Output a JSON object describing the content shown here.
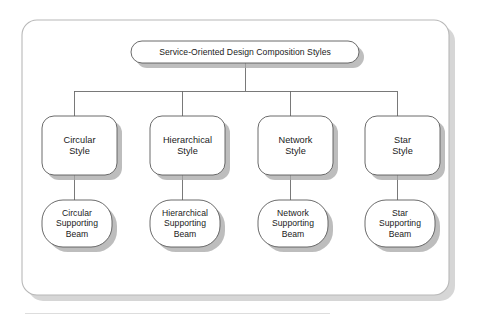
{
  "diagram": {
    "type": "tree",
    "root": {
      "id": "root",
      "label": "Service-Oriented Design Composition Styles",
      "shape": "stadium"
    },
    "columns": [
      {
        "id": "circular",
        "style": {
          "line1": "Circular",
          "line2": "Style",
          "shape": "rounded-rect"
        },
        "beam": {
          "line1": "Circular",
          "line2": "Supporting",
          "line3": "Beam",
          "shape": "stadium"
        }
      },
      {
        "id": "hierarchical",
        "style": {
          "line1": "Hierarchical",
          "line2": "Style",
          "shape": "rounded-rect"
        },
        "beam": {
          "line1": "Hierarchical",
          "line2": "Supporting",
          "line3": "Beam",
          "shape": "stadium"
        }
      },
      {
        "id": "network",
        "style": {
          "line1": "Network",
          "line2": "Style",
          "shape": "rounded-rect"
        },
        "beam": {
          "line1": "Network",
          "line2": "Supporting",
          "line3": "Beam",
          "shape": "stadium"
        }
      },
      {
        "id": "star",
        "style": {
          "line1": "Star",
          "line2": "Style",
          "shape": "rounded-rect"
        },
        "beam": {
          "line1": "Star",
          "line2": "Supporting",
          "line3": "Beam",
          "shape": "stadium"
        }
      }
    ],
    "colors": {
      "node_fill": "#ffffff",
      "node_stroke": "#5a5a5a",
      "container_stroke": "#b8b8b8",
      "shadow": "#a8a8a8",
      "connector": "#6a6a6a",
      "text": "#1a1a1a",
      "footer_rule": "#d9d9d9",
      "background": "#ffffff"
    }
  }
}
